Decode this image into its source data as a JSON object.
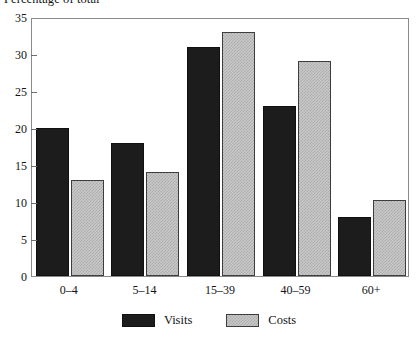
{
  "chart_data": {
    "type": "bar",
    "title": "Percentage of total",
    "xlabel": "",
    "ylabel": "",
    "categories": [
      "0–4",
      "5–14",
      "15–39",
      "40–59",
      "60+"
    ],
    "series": [
      {
        "name": "Visits",
        "color": "#1c1c1c",
        "values": [
          20,
          18,
          31,
          23,
          8
        ]
      },
      {
        "name": "Costs",
        "color": "#c9c9c9",
        "values": [
          13,
          14,
          33,
          29,
          10.3
        ]
      }
    ],
    "ylim": [
      0,
      35
    ],
    "yticks": [
      0,
      5,
      10,
      15,
      20,
      25,
      30,
      35
    ],
    "ytick_labels": [
      "0",
      "5",
      "10",
      "15",
      "20",
      "25",
      "30",
      "35"
    ],
    "grid": false,
    "legend_position": "bottom",
    "frame": true
  },
  "legend": {
    "entries": [
      {
        "label": "Visits"
      },
      {
        "label": "Costs"
      }
    ]
  }
}
